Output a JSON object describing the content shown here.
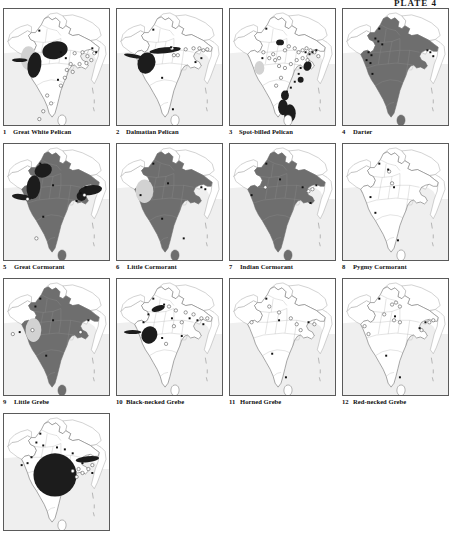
{
  "plate": {
    "label": "PLATE 4"
  },
  "legend": {
    "sea_color": "#efefef",
    "land_color": "#ffffff",
    "border_color": "#9a9a9a",
    "resident_range_color": "#6e6e6e",
    "winter_range_color": "#1a1a1a",
    "pale_range_color": "#d2d2d2",
    "record_open_symbol": "open-circle",
    "record_filled_symbol": "filled-square"
  },
  "maps": [
    {
      "number": "1",
      "name": "Great White Pelican",
      "dark_patches": [
        {
          "cx": 52,
          "cy": 42,
          "rx": 13,
          "ry": 9,
          "rot": -12
        },
        {
          "cx": 31,
          "cy": 57,
          "rx": 7,
          "ry": 13,
          "rot": 8
        },
        {
          "cx": 16,
          "cy": 52,
          "rx": 8,
          "ry": 2,
          "rot": 0
        }
      ],
      "pale_patches": [
        {
          "cx": 25,
          "cy": 50,
          "rx": 8,
          "ry": 12,
          "rot": 0
        }
      ],
      "fill_country": false,
      "open_circles": [
        [
          72,
          45
        ],
        [
          80,
          44
        ],
        [
          85,
          48
        ],
        [
          89,
          52
        ],
        [
          92,
          45
        ],
        [
          84,
          55
        ],
        [
          77,
          56
        ],
        [
          68,
          56
        ],
        [
          64,
          62
        ],
        [
          70,
          64
        ],
        [
          62,
          70
        ],
        [
          58,
          78
        ],
        [
          44,
          88
        ],
        [
          48,
          96
        ],
        [
          40,
          104
        ],
        [
          36,
          112
        ]
      ],
      "filled_dots": [
        [
          36,
          22
        ],
        [
          58,
          44
        ],
        [
          90,
          40
        ],
        [
          94,
          44
        ],
        [
          55,
          72
        ],
        [
          63,
          50
        ]
      ]
    },
    {
      "number": "2",
      "name": "Dalmatian Pelican",
      "dark_patches": [
        {
          "cx": 49,
          "cy": 42,
          "rx": 16,
          "ry": 3,
          "rot": -6
        },
        {
          "cx": 30,
          "cy": 55,
          "rx": 9,
          "ry": 11,
          "rot": 18
        },
        {
          "cx": 17,
          "cy": 48,
          "rx": 10,
          "ry": 2,
          "rot": 10
        }
      ],
      "pale_patches": [],
      "fill_country": false,
      "open_circles": [
        [
          56,
          40
        ],
        [
          58,
          47
        ],
        [
          62,
          47
        ],
        [
          70,
          41
        ],
        [
          78,
          40
        ],
        [
          84,
          40
        ],
        [
          88,
          42
        ],
        [
          92,
          41
        ]
      ],
      "filled_dots": [
        [
          37,
          21
        ],
        [
          55,
          39
        ],
        [
          86,
          50
        ],
        [
          80,
          54
        ],
        [
          46,
          70
        ],
        [
          57,
          102
        ]
      ]
    },
    {
      "number": "3",
      "name": "Spot-billed Pelican",
      "dark_patches": [
        {
          "cx": 51,
          "cy": 34,
          "rx": 4,
          "ry": 3,
          "rot": 0
        },
        {
          "cx": 79,
          "cy": 58,
          "rx": 4,
          "ry": 5,
          "rot": 20
        },
        {
          "cx": 72,
          "cy": 72,
          "rx": 3,
          "ry": 3,
          "rot": 0
        },
        {
          "cx": 56,
          "cy": 88,
          "rx": 4,
          "ry": 5,
          "rot": 0
        },
        {
          "cx": 54,
          "cy": 100,
          "rx": 5,
          "ry": 8,
          "rot": 0
        },
        {
          "cx": 61,
          "cy": 106,
          "rx": 6,
          "ry": 9,
          "rot": 0
        }
      ],
      "pale_patches": [
        {
          "cx": 30,
          "cy": 60,
          "rx": 5,
          "ry": 7,
          "rot": 0
        }
      ],
      "fill_country": false,
      "open_circles": [
        [
          34,
          44
        ],
        [
          40,
          50
        ],
        [
          46,
          52
        ],
        [
          50,
          50
        ],
        [
          44,
          46
        ],
        [
          56,
          42
        ],
        [
          60,
          38
        ],
        [
          66,
          40
        ],
        [
          70,
          44
        ],
        [
          74,
          42
        ],
        [
          78,
          40
        ],
        [
          82,
          42
        ],
        [
          86,
          44
        ],
        [
          90,
          48
        ],
        [
          50,
          58
        ],
        [
          56,
          60
        ],
        [
          62,
          56
        ],
        [
          68,
          52
        ],
        [
          74,
          50
        ],
        [
          52,
          70
        ],
        [
          47,
          78
        ],
        [
          79,
          52
        ]
      ],
      "filled_dots": [
        [
          37,
          20
        ],
        [
          77,
          44
        ],
        [
          81,
          46
        ],
        [
          84,
          44
        ],
        [
          88,
          42
        ],
        [
          72,
          60
        ],
        [
          70,
          66
        ],
        [
          66,
          74
        ],
        [
          62,
          80
        ],
        [
          58,
          84
        ],
        [
          33,
          50
        ]
      ]
    },
    {
      "number": "4",
      "name": "Darter",
      "dark_patches": [],
      "pale_patches": [],
      "fill_country": true,
      "open_circles": [],
      "filled_dots": [
        [
          37,
          20
        ],
        [
          33,
          30
        ],
        [
          36,
          33
        ],
        [
          40,
          36
        ],
        [
          26,
          44
        ],
        [
          29,
          47
        ],
        [
          24,
          52
        ],
        [
          28,
          55
        ],
        [
          86,
          42
        ],
        [
          89,
          44
        ],
        [
          92,
          48
        ],
        [
          30,
          66
        ]
      ]
    },
    {
      "number": "5",
      "name": "Great Cormorant",
      "dark_patches": [
        {
          "cx": 40,
          "cy": 27,
          "rx": 9,
          "ry": 7,
          "rot": -20
        },
        {
          "cx": 30,
          "cy": 44,
          "rx": 7,
          "ry": 12,
          "rot": 5
        },
        {
          "cx": 18,
          "cy": 54,
          "rx": 10,
          "ry": 3,
          "rot": 8
        },
        {
          "cx": 88,
          "cy": 47,
          "rx": 12,
          "ry": 5,
          "rot": -8
        },
        {
          "cx": 79,
          "cy": 53,
          "rx": 5,
          "ry": 5,
          "rot": 0
        }
      ],
      "pale_patches": [],
      "fill_country": true,
      "open_circles": [
        [
          33,
          96
        ],
        [
          24,
          56
        ],
        [
          82,
          52
        ]
      ],
      "filled_dots": [
        [
          37,
          20
        ],
        [
          50,
          42
        ],
        [
          83,
          44
        ],
        [
          78,
          50
        ],
        [
          74,
          58
        ],
        [
          40,
          74
        ]
      ]
    },
    {
      "number": "6",
      "name": "Little Cormorant",
      "dark_patches": [],
      "pale_patches": [
        {
          "cx": 28,
          "cy": 48,
          "rx": 9,
          "ry": 12,
          "rot": 0
        }
      ],
      "fill_country": true,
      "open_circles": [],
      "filled_dots": [
        [
          37,
          20
        ],
        [
          52,
          40
        ],
        [
          86,
          44
        ],
        [
          90,
          46
        ],
        [
          24,
          52
        ],
        [
          46,
          76
        ],
        [
          68,
          96
        ]
      ]
    },
    {
      "number": "7",
      "name": "Indian Cormorant",
      "dark_patches": [],
      "pale_patches": [],
      "fill_country": true,
      "fill_inset": true,
      "open_circles": [
        [
          36,
          44
        ],
        [
          80,
          48
        ],
        [
          84,
          46
        ]
      ],
      "filled_dots": [
        [
          37,
          20
        ],
        [
          51,
          36
        ],
        [
          74,
          44
        ],
        [
          88,
          42
        ],
        [
          22,
          52
        ],
        [
          82,
          60
        ]
      ]
    },
    {
      "number": "8",
      "name": "Pygmy Cormorant",
      "dark_patches": [],
      "pale_patches": [],
      "fill_country": false,
      "open_circles": [
        [
          47,
          28
        ],
        [
          50,
          40
        ]
      ],
      "filled_dots": [
        [
          37,
          20
        ],
        [
          46,
          26
        ],
        [
          52,
          44
        ],
        [
          28,
          54
        ],
        [
          33,
          70
        ],
        [
          56,
          98
        ]
      ]
    },
    {
      "number": "9",
      "name": "Little Grebe",
      "dark_patches": [],
      "pale_patches": [
        {
          "cx": 30,
          "cy": 52,
          "rx": 8,
          "ry": 12,
          "rot": 0
        }
      ],
      "fill_country": true,
      "open_circles": [
        [
          29,
          52
        ],
        [
          9,
          56
        ],
        [
          78,
          54
        ]
      ],
      "filled_dots": [
        [
          37,
          20
        ],
        [
          32,
          28
        ],
        [
          50,
          42
        ],
        [
          86,
          42
        ],
        [
          16,
          54
        ],
        [
          43,
          78
        ]
      ]
    },
    {
      "number": "10",
      "name": "Black-necked Grebe",
      "dark_patches": [
        {
          "cx": 33,
          "cy": 57,
          "rx": 8,
          "ry": 9,
          "rot": 25
        },
        {
          "cx": 16,
          "cy": 54,
          "rx": 9,
          "ry": 2,
          "rot": 0
        },
        {
          "cx": 42,
          "cy": 30,
          "rx": 7,
          "ry": 3,
          "rot": -18
        }
      ],
      "pale_patches": [],
      "fill_country": false,
      "open_circles": [
        [
          53,
          28
        ],
        [
          60,
          32
        ],
        [
          70,
          34
        ],
        [
          78,
          36
        ],
        [
          66,
          44
        ],
        [
          58,
          48
        ],
        [
          86,
          40
        ],
        [
          92,
          40
        ],
        [
          50,
          66
        ]
      ],
      "filled_dots": [
        [
          37,
          20
        ],
        [
          32,
          36
        ],
        [
          27,
          44
        ],
        [
          48,
          26
        ],
        [
          74,
          40
        ],
        [
          82,
          42
        ],
        [
          88,
          46
        ],
        [
          56,
          40
        ],
        [
          66,
          58
        ],
        [
          46,
          60
        ]
      ]
    },
    {
      "number": "11",
      "name": "Horned Grebe",
      "dark_patches": [],
      "pale_patches": [],
      "fill_country": false,
      "open_circles": [
        [
          40,
          28
        ],
        [
          50,
          34
        ],
        [
          62,
          40
        ],
        [
          22,
          44
        ],
        [
          68,
          46
        ],
        [
          72,
          52
        ],
        [
          86,
          46
        ]
      ],
      "filled_dots": [
        [
          37,
          20
        ],
        [
          50,
          42
        ],
        [
          80,
          44
        ],
        [
          43,
          76
        ],
        [
          57,
          100
        ]
      ]
    },
    {
      "number": "12",
      "name": "Red-necked Grebe",
      "dark_patches": [],
      "pale_patches": [],
      "fill_country": false,
      "open_circles": [
        [
          50,
          26
        ],
        [
          54,
          24
        ],
        [
          58,
          28
        ],
        [
          42,
          36
        ],
        [
          52,
          42
        ],
        [
          58,
          44
        ],
        [
          88,
          44
        ],
        [
          92,
          42
        ],
        [
          22,
          48
        ],
        [
          26,
          56
        ],
        [
          80,
          52
        ]
      ],
      "filled_dots": [
        [
          37,
          20
        ],
        [
          53,
          38
        ],
        [
          84,
          44
        ],
        [
          78,
          50
        ],
        [
          44,
          78
        ],
        [
          58,
          100
        ]
      ]
    },
    {
      "number": "13",
      "name": "",
      "dark_patches": [
        {
          "cx": 52,
          "cy": 62,
          "rx": 22,
          "ry": 22,
          "rot": 0
        },
        {
          "cx": 85,
          "cy": 46,
          "rx": 12,
          "ry": 3,
          "rot": -6
        }
      ],
      "pale_patches": [],
      "fill_country": false,
      "open_circles": [
        [
          70,
          58
        ],
        [
          76,
          56
        ],
        [
          80,
          60
        ],
        [
          74,
          64
        ],
        [
          86,
          56
        ],
        [
          90,
          52
        ]
      ],
      "filled_dots": [
        [
          37,
          20
        ],
        [
          33,
          29
        ],
        [
          40,
          32
        ],
        [
          28,
          44
        ],
        [
          24,
          50
        ],
        [
          54,
          34
        ],
        [
          62,
          36
        ],
        [
          70,
          40
        ],
        [
          18,
          52
        ],
        [
          90,
          60
        ],
        [
          80,
          50
        ]
      ]
    }
  ]
}
